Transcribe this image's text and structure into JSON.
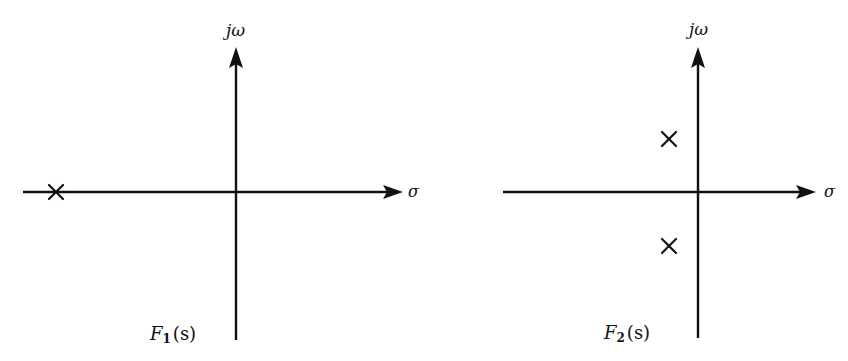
{
  "diagram": {
    "colors": {
      "ink": "#111111",
      "background": "#ffffff"
    },
    "panels": [
      {
        "id": "F1",
        "function_label": "F",
        "function_subscript": "1",
        "function_arg": "(s)",
        "function_full": "F1(s)",
        "imag_axis_label": "jω",
        "real_axis_label": "σ",
        "origin": {
          "x": 236,
          "y": 192
        },
        "real_axis": {
          "x_start": 23,
          "x_end": 403
        },
        "imag_axis": {
          "y_top": 48,
          "y_bottom": 340
        },
        "poles": [
          {
            "type": "pole",
            "symbol": "×",
            "x": 56,
            "y": 192,
            "description": "single real pole far left on negative real axis"
          }
        ]
      },
      {
        "id": "F2",
        "function_label": "F",
        "function_subscript": "2",
        "function_arg": "(s)",
        "function_full": "F2(s)",
        "imag_axis_label": "jω",
        "real_axis_label": "σ",
        "origin": {
          "x": 698,
          "y": 192
        },
        "real_axis": {
          "x_start": 503,
          "x_end": 816
        },
        "imag_axis": {
          "y_top": 48,
          "y_bottom": 338
        },
        "poles": [
          {
            "type": "pole",
            "symbol": "×",
            "x": 669,
            "y": 139,
            "description": "complex pole, upper half-plane, slightly left of jω axis"
          },
          {
            "type": "pole",
            "symbol": "×",
            "x": 669,
            "y": 246,
            "description": "complex conjugate pole, lower half-plane"
          }
        ]
      }
    ]
  }
}
